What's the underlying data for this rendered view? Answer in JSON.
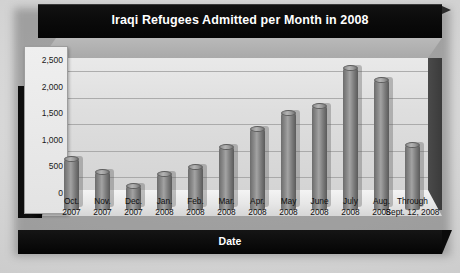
{
  "chart_data": {
    "type": "bar",
    "title": "Iraqi Refugees Admitted per Month in 2008",
    "xlabel": "Date",
    "ylabel": "Number of Refugees",
    "grid": true,
    "legend": null,
    "ylim": [
      0,
      2750
    ],
    "yticks": [
      "0",
      "500",
      "1,000",
      "1,500",
      "2,000",
      "2,500"
    ],
    "ytick_values": [
      0,
      500,
      1000,
      1500,
      2000,
      2500
    ],
    "categories": [
      "Oct. 2007",
      "Nov. 2007",
      "Dec. 2007",
      "Jan. 2008",
      "Feb. 2008",
      "Mar. 2008",
      "Apr. 2008",
      "May 2008",
      "June 2008",
      "July 2008",
      "Aug. 2008",
      "Through Sept. 12, 2008"
    ],
    "category_lines": [
      [
        "Oct.",
        "2007"
      ],
      [
        "Nov.",
        "2007"
      ],
      [
        "Dec.",
        "2007"
      ],
      [
        "Jan.",
        "2008"
      ],
      [
        "Feb.",
        "2008"
      ],
      [
        "Mar.",
        "2008"
      ],
      [
        "Apr.",
        "2008"
      ],
      [
        "May",
        "2008"
      ],
      [
        "June",
        "2008"
      ],
      [
        "July",
        "2008"
      ],
      [
        "Aug.",
        "2008"
      ],
      [
        "Through",
        "Sept. 12, 2008"
      ]
    ],
    "values": [
      1080,
      820,
      560,
      790,
      930,
      1300,
      1640,
      1940,
      2080,
      2780,
      2560,
      1330
    ],
    "bar_color": "#8c8c8c",
    "plot_bg_color": "#e0e0e0",
    "frame_color": "#0a0a0a",
    "text_color": "#ffffff"
  }
}
